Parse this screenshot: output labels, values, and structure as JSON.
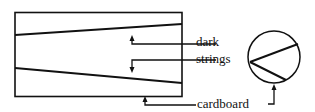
{
  "diagram": {
    "labels": {
      "dark": "dark",
      "strings": "strings",
      "cardboard": "cardboard"
    },
    "colors": {
      "ink": "#111111",
      "background": "#ffffff"
    }
  }
}
